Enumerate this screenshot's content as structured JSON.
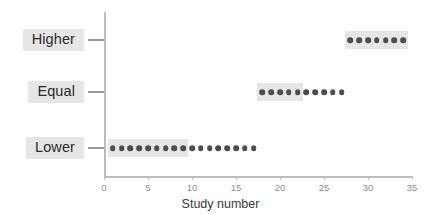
{
  "chart_data": {
    "type": "scatter",
    "title": "",
    "xlabel": "Study number",
    "ylabel": "",
    "xlim": [
      0,
      35
    ],
    "xticks": [
      0,
      5,
      10,
      15,
      20,
      25,
      30,
      35
    ],
    "xtick_labels": [
      "0",
      "5",
      "10",
      "15",
      "20",
      "25",
      "30",
      "35"
    ],
    "grid": false,
    "legend": "none",
    "categories": [
      "Lower",
      "Equal",
      "Higher"
    ],
    "dot_color": "#4d4d4d",
    "highlight_color": "#e6e6e6",
    "axis_color": "#bdbdbd",
    "series": [
      {
        "name": "Lower",
        "row": 0,
        "x": [
          1,
          2,
          3,
          4,
          5,
          6,
          7,
          8,
          9,
          10,
          11,
          12,
          13,
          14,
          15,
          16,
          17
        ],
        "count": 17,
        "highlighted_x": [
          1,
          2,
          3,
          4,
          5,
          6,
          7,
          8,
          9
        ],
        "highlight_range": [
          1,
          9
        ]
      },
      {
        "name": "Equal",
        "row": 1,
        "x": [
          18,
          19,
          20,
          21,
          22,
          23,
          24,
          25,
          26,
          27
        ],
        "count": 10,
        "highlighted_x": [
          18,
          19,
          20,
          21,
          22
        ],
        "highlight_range": [
          18,
          22
        ]
      },
      {
        "name": "Higher",
        "row": 2,
        "x": [
          28,
          29,
          30,
          31,
          32,
          33,
          34
        ],
        "count": 7,
        "highlighted_x": [
          28,
          29,
          30,
          31,
          32,
          33,
          34
        ],
        "highlight_range": [
          28,
          34
        ]
      }
    ]
  },
  "labels": {
    "lower": "Lower",
    "equal": "Equal",
    "higher": "Higher",
    "x_axis_title": "Study number"
  }
}
